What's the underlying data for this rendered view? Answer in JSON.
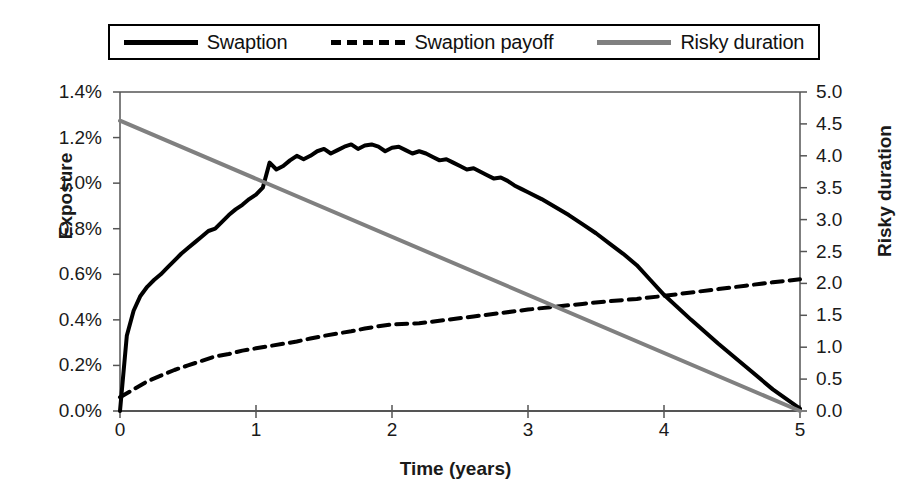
{
  "legend": {
    "entries": [
      {
        "label": "Swaption",
        "style": "solid",
        "color": "#000000"
      },
      {
        "label": "Swaption payoff",
        "style": "dashed",
        "color": "#000000"
      },
      {
        "label": "Risky duration",
        "style": "solid",
        "color": "#808080"
      }
    ]
  },
  "axes": {
    "y_left_title": "Exposure",
    "y_right_title": "Risky duration",
    "x_title": "Time (years)",
    "y_left_ticks": [
      "0.0%",
      "0.2%",
      "0.4%",
      "0.6%",
      "0.8%",
      "1.0%",
      "1.2%",
      "1.4%"
    ],
    "y_right_ticks": [
      "0.0",
      "0.5",
      "1.0",
      "1.5",
      "2.0",
      "2.5",
      "3.0",
      "3.5",
      "4.0",
      "4.5",
      "5.0"
    ],
    "x_ticks": [
      "0",
      "1",
      "2",
      "3",
      "4",
      "5"
    ]
  },
  "chart_data": {
    "type": "line",
    "title": "",
    "xlabel": "Time (years)",
    "ylabel": "Exposure",
    "y2label": "Risky duration",
    "xlim": [
      0,
      5
    ],
    "ylim": [
      0.0,
      1.4
    ],
    "y2lim": [
      0.0,
      5.0
    ],
    "xticks": [
      0,
      1,
      2,
      3,
      4,
      5
    ],
    "yticks": [
      0.0,
      0.2,
      0.4,
      0.6,
      0.8,
      1.0,
      1.2,
      1.4
    ],
    "y2ticks": [
      0.0,
      0.5,
      1.0,
      1.5,
      2.0,
      2.5,
      3.0,
      3.5,
      4.0,
      4.5,
      5.0
    ],
    "grid": false,
    "legend_position": "top",
    "y_unit": "percent",
    "series": [
      {
        "name": "Swaption",
        "axis": "left",
        "style": "solid",
        "color": "#000000",
        "width": 4,
        "x": [
          0.0,
          0.05,
          0.1,
          0.15,
          0.2,
          0.25,
          0.3,
          0.35,
          0.4,
          0.45,
          0.5,
          0.55,
          0.6,
          0.65,
          0.7,
          0.75,
          0.8,
          0.85,
          0.9,
          0.95,
          1.0,
          1.05,
          1.1,
          1.15,
          1.2,
          1.25,
          1.3,
          1.35,
          1.4,
          1.45,
          1.5,
          1.55,
          1.6,
          1.65,
          1.7,
          1.75,
          1.8,
          1.85,
          1.9,
          1.95,
          2.0,
          2.05,
          2.1,
          2.15,
          2.2,
          2.25,
          2.3,
          2.35,
          2.4,
          2.45,
          2.5,
          2.55,
          2.6,
          2.65,
          2.7,
          2.75,
          2.8,
          2.85,
          2.9,
          2.95,
          3.0,
          3.1,
          3.2,
          3.3,
          3.4,
          3.5,
          3.6,
          3.7,
          3.8,
          3.9,
          4.0,
          4.2,
          4.4,
          4.6,
          4.8,
          5.0
        ],
        "y": [
          0.0,
          0.33,
          0.44,
          0.505,
          0.545,
          0.575,
          0.6,
          0.63,
          0.66,
          0.69,
          0.715,
          0.74,
          0.765,
          0.79,
          0.8,
          0.83,
          0.86,
          0.885,
          0.905,
          0.93,
          0.95,
          0.98,
          1.09,
          1.06,
          1.075,
          1.1,
          1.12,
          1.105,
          1.12,
          1.14,
          1.15,
          1.13,
          1.145,
          1.16,
          1.17,
          1.15,
          1.165,
          1.17,
          1.16,
          1.14,
          1.155,
          1.16,
          1.145,
          1.13,
          1.14,
          1.13,
          1.115,
          1.1,
          1.105,
          1.09,
          1.075,
          1.06,
          1.065,
          1.05,
          1.035,
          1.02,
          1.025,
          1.01,
          0.99,
          0.975,
          0.96,
          0.93,
          0.895,
          0.86,
          0.82,
          0.78,
          0.735,
          0.69,
          0.64,
          0.575,
          0.51,
          0.4,
          0.295,
          0.195,
          0.095,
          0.01
        ]
      },
      {
        "name": "Swaption payoff",
        "axis": "left",
        "style": "dashed",
        "color": "#000000",
        "width": 4,
        "x": [
          0.0,
          0.1,
          0.2,
          0.3,
          0.4,
          0.5,
          0.6,
          0.7,
          0.8,
          0.9,
          1.0,
          1.1,
          1.2,
          1.3,
          1.4,
          1.5,
          1.6,
          1.7,
          1.8,
          1.9,
          2.0,
          2.2,
          2.4,
          2.6,
          2.8,
          3.0,
          3.2,
          3.4,
          3.6,
          3.8,
          4.0,
          4.2,
          4.4,
          4.6,
          4.8,
          5.0
        ],
        "y": [
          0.06,
          0.095,
          0.13,
          0.155,
          0.18,
          0.2,
          0.22,
          0.24,
          0.25,
          0.265,
          0.275,
          0.285,
          0.295,
          0.305,
          0.318,
          0.33,
          0.34,
          0.35,
          0.362,
          0.372,
          0.38,
          0.385,
          0.4,
          0.415,
          0.43,
          0.445,
          0.458,
          0.47,
          0.482,
          0.492,
          0.505,
          0.52,
          0.535,
          0.55,
          0.565,
          0.578
        ]
      },
      {
        "name": "Risky duration",
        "axis": "right",
        "style": "solid",
        "color": "#808080",
        "width": 4,
        "x": [
          0.0,
          5.0
        ],
        "y": [
          4.55,
          0.0
        ]
      }
    ]
  }
}
